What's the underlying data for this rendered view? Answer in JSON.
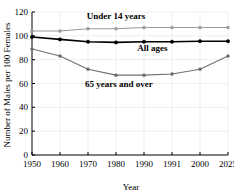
{
  "chart_data": {
    "type": "line",
    "title": "",
    "xlabel": "Year",
    "ylabel": "Number of Males per 100 Females",
    "categories": [
      "1950",
      "1960",
      "1970",
      "1980",
      "1990",
      "1991",
      "2000",
      "2025"
    ],
    "ylim": [
      0,
      120
    ],
    "yticks": [
      0,
      20,
      40,
      60,
      80,
      100,
      120
    ],
    "ytick_labels": [
      "0",
      "20",
      "40",
      "60",
      "80",
      "100",
      "120"
    ],
    "grid": true,
    "legend_position": "inline-annotations",
    "series": [
      {
        "name": "Under 14 years",
        "color": "#9a9a9a",
        "values": [
          104,
          104,
          106,
          106,
          107,
          107,
          107,
          107
        ]
      },
      {
        "name": "All ages",
        "color": "#000000",
        "values": [
          99,
          97,
          95,
          94.5,
          95,
          95,
          95.5,
          95.5
        ]
      },
      {
        "name": "65 years and over",
        "color": "#6e6e6e",
        "values": [
          89,
          83,
          72,
          67,
          67,
          68,
          72,
          83
        ]
      }
    ],
    "annotations": [
      {
        "text": "Under 14 years",
        "x_index": 3.0,
        "y_value": 114
      },
      {
        "text": "All ages",
        "x_index": 4.3,
        "y_value": 87
      },
      {
        "text": "65 years and over",
        "x_index": 3.1,
        "y_value": 57
      }
    ]
  },
  "axis": {
    "x_title": "Year",
    "y_title": "Number of Males per 100 Females"
  }
}
